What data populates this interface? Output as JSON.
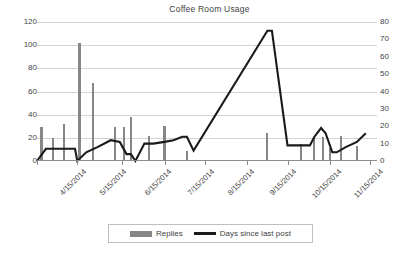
{
  "chart_data": {
    "type": "line",
    "title": "Coffee Room Usage",
    "xlabel": "",
    "ylabel": "",
    "grid": true,
    "legend_position": "bottom",
    "y_left": {
      "label": "Replies",
      "ticks": [
        0,
        20,
        40,
        60,
        80,
        100,
        120
      ],
      "ylim": [
        0,
        120
      ]
    },
    "y_right": {
      "label": "Days since last post",
      "ticks": [
        0,
        10,
        20,
        30,
        40,
        50,
        60,
        70,
        80
      ],
      "ylim": [
        0,
        80
      ]
    },
    "x_tick_labels": [
      "4/15/2014",
      "5/15/2014",
      "6/15/2014",
      "7/15/2014",
      "8/15/2014",
      "9/15/2014",
      "10/15/2014",
      "11/15/2014"
    ],
    "legend": [
      {
        "name": "Replies",
        "type": "bar",
        "color": "#878787"
      },
      {
        "name": "Days since last post",
        "type": "line",
        "color": "#1a1a1a"
      }
    ],
    "series": [
      {
        "name": "Replies",
        "axis": "left",
        "type": "bar",
        "color": "#878787",
        "points": [
          {
            "x": 2,
            "value": 29
          },
          {
            "x": 7,
            "value": 20
          },
          {
            "x": 12,
            "value": 32
          },
          {
            "x": 19,
            "value": 102
          },
          {
            "x": 25,
            "value": 67
          },
          {
            "x": 35,
            "value": 29
          },
          {
            "x": 39,
            "value": 29
          },
          {
            "x": 42,
            "value": 38
          },
          {
            "x": 50,
            "value": 22
          },
          {
            "x": 57,
            "value": 30
          },
          {
            "x": 67,
            "value": 9
          },
          {
            "x": 103,
            "value": 24
          },
          {
            "x": 118,
            "value": 15
          },
          {
            "x": 124,
            "value": 20
          },
          {
            "x": 128,
            "value": 21
          },
          {
            "x": 131,
            "value": 11
          },
          {
            "x": 136,
            "value": 22
          },
          {
            "x": 143,
            "value": 13
          }
        ]
      },
      {
        "name": "Days since last post",
        "axis": "right",
        "type": "line",
        "color": "#1a1a1a",
        "points": [
          {
            "x": 0,
            "value": 0
          },
          {
            "x": 4,
            "value": 7
          },
          {
            "x": 7,
            "value": 7
          },
          {
            "x": 12,
            "value": 7
          },
          {
            "x": 17,
            "value": 7
          },
          {
            "x": 18,
            "value": 0
          },
          {
            "x": 22,
            "value": 5
          },
          {
            "x": 27,
            "value": 8
          },
          {
            "x": 33,
            "value": 12
          },
          {
            "x": 37,
            "value": 11
          },
          {
            "x": 40,
            "value": 4
          },
          {
            "x": 42,
            "value": 4
          },
          {
            "x": 44,
            "value": 0
          },
          {
            "x": 48,
            "value": 10
          },
          {
            "x": 52,
            "value": 10
          },
          {
            "x": 57,
            "value": 11
          },
          {
            "x": 61,
            "value": 12
          },
          {
            "x": 65,
            "value": 14
          },
          {
            "x": 67,
            "value": 14
          },
          {
            "x": 70,
            "value": 6
          },
          {
            "x": 103,
            "value": 75
          },
          {
            "x": 105,
            "value": 75
          },
          {
            "x": 112,
            "value": 9
          },
          {
            "x": 118,
            "value": 9
          },
          {
            "x": 122,
            "value": 9
          },
          {
            "x": 124,
            "value": 14
          },
          {
            "x": 127,
            "value": 19
          },
          {
            "x": 129,
            "value": 16
          },
          {
            "x": 132,
            "value": 5
          },
          {
            "x": 134,
            "value": 5
          },
          {
            "x": 138,
            "value": 8
          },
          {
            "x": 143,
            "value": 11
          },
          {
            "x": 147,
            "value": 16
          }
        ]
      }
    ]
  }
}
